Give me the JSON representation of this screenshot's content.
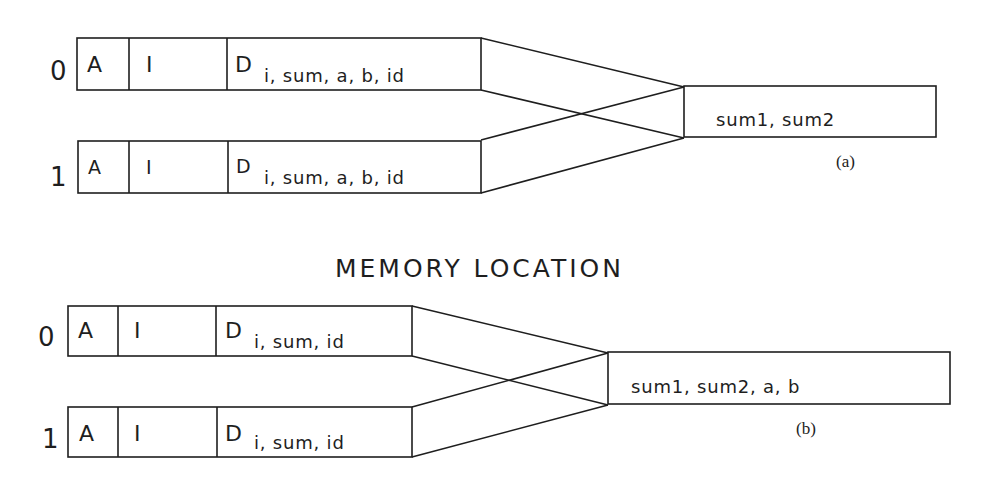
{
  "title": "MEMORY LOCATION",
  "panels": [
    {
      "id": "a",
      "caption": "(a)",
      "processes": [
        {
          "index": "0",
          "segments": {
            "A": "A",
            "I": "I",
            "D": "D",
            "D_vars": "i, sum, a, b, id"
          }
        },
        {
          "index": "1",
          "segments": {
            "A": "A",
            "I": "I",
            "D": "D",
            "D_vars": "i, sum, a, b, id"
          }
        }
      ],
      "shared": {
        "vars": "sum1, sum2"
      }
    },
    {
      "id": "b",
      "caption": "(b)",
      "processes": [
        {
          "index": "0",
          "segments": {
            "A": "A",
            "I": "I",
            "D": "D",
            "D_vars": "i, sum, id"
          }
        },
        {
          "index": "1",
          "segments": {
            "A": "A",
            "I": "I",
            "D": "D",
            "D_vars": "i, sum, id"
          }
        }
      ],
      "shared": {
        "vars": "sum1, sum2, a, b"
      }
    }
  ],
  "colors": {
    "line": "#1e1e1e",
    "background": "#ffffff"
  }
}
